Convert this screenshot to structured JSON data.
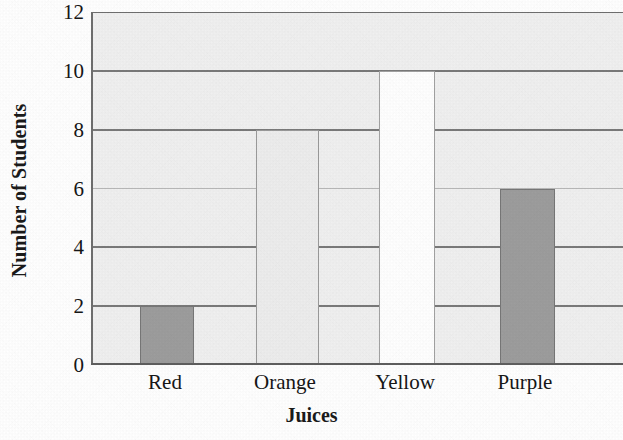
{
  "chart_data": {
    "type": "bar",
    "title": "",
    "xlabel": "Juices",
    "ylabel": "Number of Students",
    "categories": [
      "Red",
      "Orange",
      "Yellow",
      "Purple"
    ],
    "values": [
      2,
      8,
      10,
      6
    ],
    "ylim": [
      0,
      12
    ],
    "y_ticks": [
      0,
      2,
      4,
      6,
      8,
      10,
      12
    ],
    "y_tick_labels": [
      "0",
      "2",
      "4",
      "6",
      "8",
      "10",
      "12"
    ],
    "grid": true,
    "legend": "none",
    "orientation": "vertical",
    "bar_fills": [
      "#9d9d9d",
      "#ededed",
      "#ffffff",
      "#9d9d9d"
    ],
    "series": [
      {
        "name": "Number of Students",
        "points": [
          {
            "category": "Red",
            "value": 2,
            "fill": "#9d9d9d",
            "fill_name": "dark-gray"
          },
          {
            "category": "Orange",
            "value": 8,
            "fill": "#ededed",
            "fill_name": "pale-gray"
          },
          {
            "category": "Yellow",
            "value": 10,
            "fill": "#ffffff",
            "fill_name": "white"
          },
          {
            "category": "Purple",
            "value": 6,
            "fill": "#9d9d9d",
            "fill_name": "dark-gray"
          }
        ]
      }
    ]
  },
  "colors": {
    "plot_background": "#f0f0f0",
    "gridline": "#7a7a7a",
    "axis_line": "#5f5f5f",
    "text": "#161616",
    "bar_dark": "#9d9d9d",
    "bar_pale": "#ededed",
    "bar_white": "#ffffff"
  }
}
